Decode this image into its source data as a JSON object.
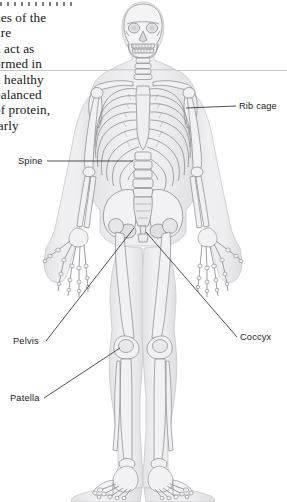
{
  "page": {
    "kind": "anatomy-textbook-page",
    "width": 287,
    "height": 502,
    "background_color": "#ffffff"
  },
  "rules": {
    "dotted_rule": {
      "name": "dotted-rule",
      "color": "#7b7b83"
    },
    "hairline": {
      "name": "horizontal-hairline",
      "color": "#c9c9cc"
    }
  },
  "body_copy": {
    "note": "paragraph is clipped by the left page margin; only partial words are visible",
    "lines": [
      "nes of the",
      "ure",
      "d act as",
      "ormed in",
      "n healthy",
      "balanced",
      "of protein,",
      "larly"
    ]
  },
  "figure": {
    "name": "human-skeleton-anterior-view",
    "outline_color": "#8c8c93",
    "bone_fill": "#f3f3f4",
    "body_silhouette": "#ececee",
    "leader_line_color": "#2f2f38"
  },
  "labels": [
    {
      "id": "rib-cage",
      "text": "Rib cage",
      "side": "right",
      "x": 239,
      "y": 101
    },
    {
      "id": "spine",
      "text": "Spine",
      "side": "left",
      "x": 18,
      "y": 156
    },
    {
      "id": "coccyx",
      "text": "Coccyx",
      "side": "right",
      "x": 240,
      "y": 332
    },
    {
      "id": "pelvis",
      "text": "Pelvis",
      "side": "left",
      "x": 13,
      "y": 336
    },
    {
      "id": "patella",
      "text": "Patella",
      "side": "left",
      "x": 10,
      "y": 393
    }
  ]
}
